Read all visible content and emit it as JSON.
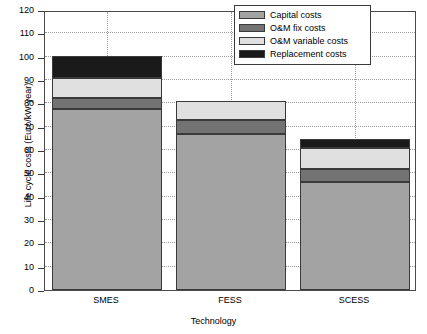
{
  "chart_data": {
    "type": "bar",
    "subtype": "stacked-bar",
    "title": "",
    "xlabel": "Technology",
    "ylabel": "Life cycle costs (Euro/kW-year)",
    "categories": [
      "SMES",
      "FESS",
      "SCESS"
    ],
    "ylim": [
      0,
      120
    ],
    "yticks": [
      0,
      10,
      20,
      30,
      40,
      50,
      60,
      70,
      80,
      90,
      100,
      110,
      120
    ],
    "ytick_labels": [
      "0",
      "10",
      "20",
      "30",
      "40",
      "50",
      "60",
      "70",
      "80",
      "90",
      "100",
      "110",
      "120"
    ],
    "grid": "dotted-both-axes",
    "legend_position": "top-right",
    "series": [
      {
        "name": "Capital costs",
        "color": "#a3a3a3",
        "values": [
          77.5,
          67.0,
          46.5
        ]
      },
      {
        "name": "O&M fix costs",
        "color": "#737373",
        "values": [
          5.0,
          6.0,
          5.5
        ]
      },
      {
        "name": "O&M variable costs",
        "color": "#e0e0e0",
        "values": [
          8.5,
          8.0,
          9.0
        ]
      },
      {
        "name": "Replacement costs",
        "color": "#1a1a1a",
        "values": [
          9.5,
          0.0,
          3.8
        ]
      }
    ],
    "totals": [
      100.5,
      81.0,
      64.8
    ]
  },
  "legend": {
    "items": [
      {
        "label": "Capital costs",
        "color": "#a3a3a3"
      },
      {
        "label": "O&M fix costs",
        "color": "#737373"
      },
      {
        "label": "O&M variable costs",
        "color": "#e0e0e0"
      },
      {
        "label": "Replacement costs",
        "color": "#1a1a1a"
      }
    ]
  },
  "axes": {
    "x_label": "Technology",
    "y_label": "Life cycle costs (Euro/kW-year)"
  }
}
